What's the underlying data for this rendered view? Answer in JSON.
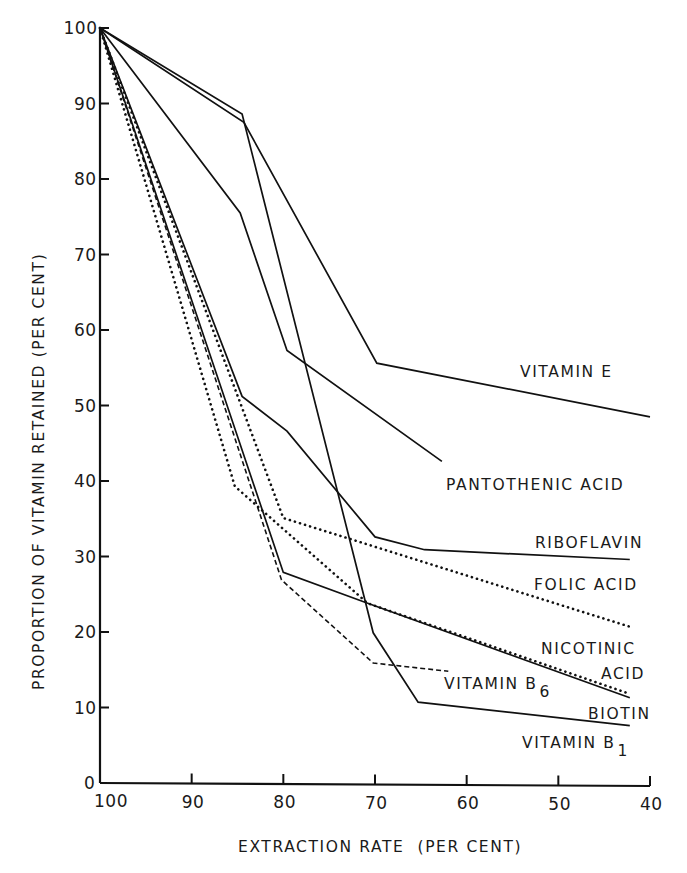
{
  "chart_data": {
    "type": "line",
    "title": "",
    "xlabel": "EXTRACTION RATE (PER CENT)",
    "ylabel": "PROPORTION OF VITAMIN RETAINED (PER CENT)",
    "xlim": [
      100,
      40
    ],
    "ylim": [
      0,
      100
    ],
    "x_ticks": [
      100,
      90,
      80,
      70,
      60,
      50,
      40
    ],
    "y_ticks": [
      0,
      10,
      20,
      30,
      40,
      50,
      60,
      70,
      80,
      90,
      100
    ],
    "grid": false,
    "legend": "inline labels at line ends",
    "series": [
      {
        "name": "VITAMIN E",
        "style": "solid",
        "x": [
          100,
          84.3,
          69.8,
          40
        ],
        "y": [
          100,
          87.5,
          55.6,
          48.5
        ]
      },
      {
        "name": "PANTOTHENIC ACID",
        "style": "solid",
        "x": [
          100,
          84.7,
          79.6,
          62.7
        ],
        "y": [
          100,
          75.5,
          57.3,
          42.6
        ]
      },
      {
        "name": "RIBOFLAVIN",
        "style": "solid",
        "x": [
          100,
          84.5,
          79.6,
          70.0,
          64.6,
          42.2
        ],
        "y": [
          100,
          51.2,
          46.6,
          32.6,
          30.9,
          29.6
        ]
      },
      {
        "name": "FOLIC ACID",
        "style": "dotted",
        "x": [
          100,
          80.0,
          42.2
        ],
        "y": [
          100,
          35.1,
          20.7
        ]
      },
      {
        "name": "NICOTINIC ACID",
        "style": "solid",
        "x": [
          100,
          80.0,
          70.8,
          42.2
        ],
        "y": [
          100,
          27.9,
          23.8,
          11.3
        ]
      },
      {
        "name": "VITAMIN B6",
        "style": "dashed",
        "x": [
          100,
          80.2,
          70.2,
          62.0
        ],
        "y": [
          100,
          26.9,
          15.9,
          14.8
        ]
      },
      {
        "name": "BIOTIN",
        "style": "dotted",
        "x": [
          100,
          85.3,
          70.8,
          42.2
        ],
        "y": [
          100,
          39.3,
          23.8,
          11.8
        ]
      },
      {
        "name": "VITAMIN B1",
        "style": "solid",
        "x": [
          100,
          84.5,
          70.2,
          65.3,
          42.2
        ],
        "y": [
          100,
          88.6,
          19.9,
          10.7,
          7.6
        ]
      }
    ],
    "labels": [
      {
        "text": "VITAMIN E",
        "x": 520,
        "y": 377
      },
      {
        "text": "PANTOTHENIC ACID",
        "x": 446,
        "y": 490
      },
      {
        "text": "RIBOFLAVIN",
        "x": 535,
        "y": 548
      },
      {
        "text": "FOLIC ACID",
        "x": 534,
        "y": 590
      },
      {
        "text": "NICOTINIC",
        "x": 541,
        "y": 654
      },
      {
        "text": "ACID",
        "x": 601,
        "y": 679
      },
      {
        "text": "VITAMIN B",
        "sub": "6",
        "x": 444,
        "y": 689
      },
      {
        "text": "BIOTIN",
        "x": 588,
        "y": 719
      },
      {
        "text": "VITAMIN B",
        "sub": "1",
        "x": 522,
        "y": 748
      }
    ]
  },
  "axes": {
    "x_title": "EXTRACTION RATE  (PER CENT)",
    "y_title": "PROPORTION OF VITAMIN RETAINED (PER CENT)"
  },
  "colors": {
    "ink": "#111111",
    "background": "#ffffff"
  }
}
